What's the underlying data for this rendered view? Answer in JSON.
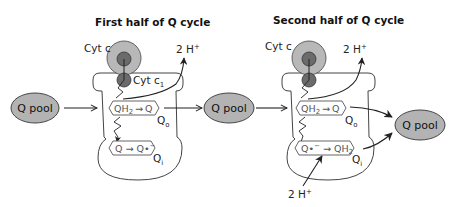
{
  "diagram": {
    "colors": {
      "pool_fill": "#b3b3b3",
      "cyt_c_outer": "#b8b8b8",
      "heme_fill": "#6b6b6b",
      "outline": "#333333",
      "reaction_text": "#555555"
    },
    "panels": [
      {
        "title": "First half of Q cycle",
        "cyt_c_label": "Cyt c",
        "cyt_c1_label": "Cyt c",
        "cyt_c1_sub": "1",
        "proton_out": "2 H",
        "proton_sup": "+",
        "qo_reaction": {
          "left": "QH",
          "left_sub": "2",
          "arrow": "→",
          "right": "Q"
        },
        "qo_site": "Q",
        "qo_sub": "o",
        "qi_reaction": {
          "left": "Q",
          "arrow": "→",
          "right": "Q•",
          "right_sup": "−"
        },
        "qi_site": "Q",
        "qi_sub": "i",
        "input_pool": "Q pool"
      },
      {
        "title": "Second half of Q cycle",
        "cyt_c_label": "Cyt c",
        "proton_out": "2 H",
        "proton_sup": "+",
        "qo_reaction": {
          "left": "QH",
          "left_sub": "2",
          "arrow": "→",
          "right": "Q"
        },
        "qo_site": "Q",
        "qo_sub": "o",
        "qi_reaction": {
          "left": "Q•",
          "left_sup": "−",
          "arrow": "→",
          "right": "QH",
          "right_sub": "2"
        },
        "qi_site": "Q",
        "qi_sub": "i",
        "input_pool": "Q pool",
        "output_pool": "Q pool",
        "proton_in": "2 H",
        "proton_in_sup": "+"
      }
    ]
  }
}
